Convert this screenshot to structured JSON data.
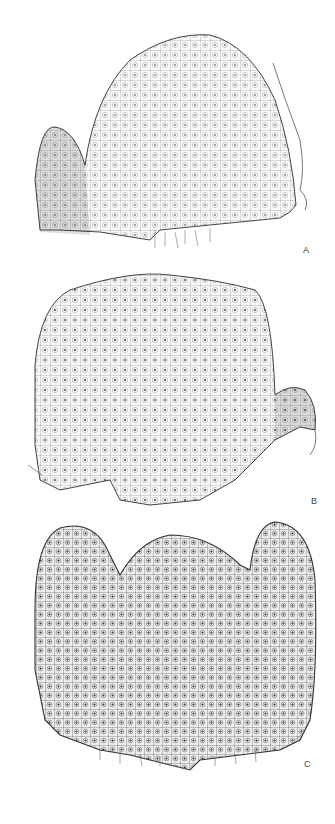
{
  "figure": {
    "panels": [
      {
        "id": "A",
        "label": "A"
      },
      {
        "id": "B",
        "label": "B"
      },
      {
        "id": "C",
        "label": "C"
      }
    ]
  },
  "colors": {
    "background": "#ffffff",
    "cell_line": "#6a6a6a",
    "outline": "#444444"
  }
}
